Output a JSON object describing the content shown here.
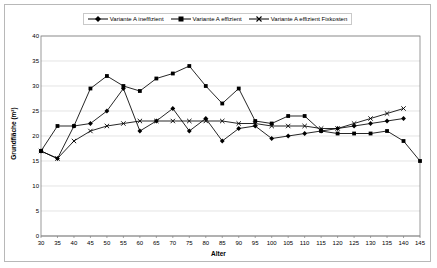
{
  "figure": {
    "background": "#ffffff",
    "border_color": "#b8b8b8",
    "plot_border_color": "#808080",
    "grid_color": "#d9d9d9",
    "series_color": "#000000"
  },
  "legend": {
    "position": "top-center",
    "items": [
      {
        "label": "Variante A ineffizient",
        "marker": "diamond-marker"
      },
      {
        "label": "Variante A effizient",
        "marker": "square-marker"
      },
      {
        "label": "Variante A effizient Fixkosten",
        "marker": "cross-marker"
      }
    ]
  },
  "axes": {
    "xlabel": "Alter",
    "ylabel": "Grundfläche (m²)",
    "yticks": [
      "40",
      "35",
      "30",
      "25",
      "20",
      "15",
      "10",
      "5",
      "0"
    ],
    "xticks": [
      "30",
      "35",
      "40",
      "45",
      "50",
      "55",
      "60",
      "65",
      "70",
      "75",
      "80",
      "85",
      "90",
      "95",
      "100",
      "105",
      "110",
      "115",
      "120",
      "125",
      "130",
      "135",
      "140",
      "145"
    ]
  },
  "chart_data": {
    "type": "line",
    "title": "",
    "xlabel": "Alter",
    "ylabel": "Grundfläche (m²)",
    "xlim": [
      30,
      145
    ],
    "ylim": [
      0,
      40
    ],
    "ytick_step": 5,
    "xtick_step": 5,
    "grid": true,
    "legend_position": "top-center",
    "x": [
      30,
      35,
      40,
      45,
      50,
      55,
      60,
      65,
      70,
      75,
      80,
      85,
      90,
      95,
      100,
      105,
      110,
      115,
      120,
      125,
      130,
      135,
      140,
      145
    ],
    "series": [
      {
        "name": "Variante A ineffizient",
        "marker": "diamond",
        "values": [
          17.0,
          15.5,
          22.0,
          22.5,
          25.0,
          29.5,
          21.0,
          23.0,
          25.5,
          21.0,
          23.5,
          19.0,
          21.5,
          22.0,
          19.5,
          20.0,
          20.5,
          21.0,
          21.5,
          22.0,
          22.5,
          23.0,
          23.5,
          null
        ]
      },
      {
        "name": "Variante A effizient",
        "marker": "square",
        "values": [
          17.0,
          22.0,
          22.0,
          29.5,
          32.0,
          30.0,
          29.0,
          31.5,
          32.5,
          34.0,
          30.0,
          26.5,
          29.5,
          23.0,
          22.5,
          24.0,
          24.0,
          21.0,
          20.5,
          20.5,
          20.5,
          21.0,
          19.0,
          15.0
        ]
      },
      {
        "name": "Variante A effizient Fixkosten",
        "marker": "cross",
        "values": [
          17.0,
          15.5,
          19.0,
          21.0,
          22.0,
          22.5,
          23.0,
          23.0,
          23.0,
          23.0,
          23.0,
          23.0,
          22.5,
          22.5,
          22.0,
          22.0,
          22.0,
          21.5,
          21.5,
          22.5,
          23.5,
          24.5,
          25.5,
          null
        ]
      }
    ]
  }
}
